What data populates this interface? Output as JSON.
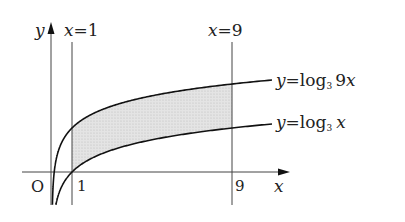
{
  "diagram": {
    "axes": {
      "x_label": "x",
      "y_label": "y",
      "origin_label": "O",
      "x_ticks": [
        "1",
        "9"
      ]
    },
    "vertical_lines": [
      {
        "label_var": "x",
        "label_eq": "=",
        "label_val": "1"
      },
      {
        "label_var": "x",
        "label_eq": "=",
        "label_val": "9"
      }
    ],
    "curves": [
      {
        "name": "upper",
        "label_y": "y",
        "label_eq": "=",
        "label_fn": "log",
        "label_base": "3",
        "label_arg_num": "9",
        "label_arg_var": "x"
      },
      {
        "name": "lower",
        "label_y": "y",
        "label_eq": "=",
        "label_fn": "log",
        "label_base": "3",
        "label_arg_var": "x"
      }
    ],
    "shaded_region": "between curves from x=1 to x=9",
    "colors": {
      "curve": "#111111",
      "axis": "#444444",
      "shade": "#d9d9d9"
    }
  }
}
